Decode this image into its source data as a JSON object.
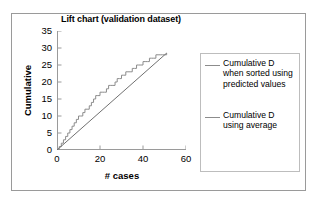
{
  "chart_data": {
    "type": "line",
    "title": "Lift chart (validation dataset)",
    "xlabel": "# cases",
    "ylabel": "Cumulative",
    "xlim": [
      0,
      60
    ],
    "ylim": [
      0,
      35
    ],
    "xticks": [
      "0",
      "20",
      "40",
      "60"
    ],
    "xtick_values": [
      0,
      20,
      40,
      60
    ],
    "yticks": [
      "0",
      "5",
      "10",
      "15",
      "20",
      "25",
      "30",
      "35"
    ],
    "ytick_values": [
      0,
      5,
      10,
      15,
      20,
      25,
      30,
      35
    ],
    "grid": false,
    "legend_position": "right",
    "series": [
      {
        "name": "Cumulative D when sorted using predicted values",
        "color": "#8c8c8c",
        "style": "step",
        "x": [
          0,
          1,
          2,
          3,
          4,
          5,
          6,
          7,
          8,
          9,
          10,
          11,
          12,
          13,
          14,
          15,
          16,
          17,
          18,
          19,
          20,
          21,
          22,
          23,
          24,
          25,
          26,
          27,
          28,
          29,
          30,
          31,
          32,
          33,
          34,
          35,
          36,
          37,
          38,
          39,
          40,
          41,
          42,
          43,
          44,
          45,
          46,
          47,
          48,
          49,
          50,
          51
        ],
        "values": [
          0,
          1,
          2,
          3,
          4,
          5,
          6,
          7,
          8,
          9,
          10,
          10,
          11,
          12,
          12,
          13,
          14,
          15,
          16,
          16,
          17,
          17,
          17,
          18,
          19,
          19,
          19,
          20,
          21,
          21,
          22,
          22,
          23,
          23,
          23,
          24,
          24,
          25,
          25,
          25,
          26,
          26,
          26,
          27,
          27,
          27,
          28,
          28,
          28,
          28,
          28,
          28.5
        ]
      },
      {
        "name": "Cumulative D using average",
        "color": "#707070",
        "style": "line",
        "x": [
          0,
          51
        ],
        "values": [
          0,
          28.5
        ]
      }
    ]
  },
  "legend": {
    "entries": [
      {
        "label": "Cumulative D when sorted using predicted values"
      },
      {
        "label": "Cumulative D using average"
      }
    ]
  }
}
